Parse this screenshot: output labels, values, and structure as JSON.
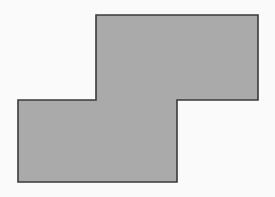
{
  "figure": {
    "name": "step-polygon-figure",
    "canvas": {
      "width": 275,
      "height": 197,
      "background_color": "#fafafa"
    },
    "shape": {
      "name": "z-step-hexagon",
      "type": "polygon",
      "vertex_count": 8,
      "fill_color": "#aaaaaa",
      "stroke_color": "#3a3a3a",
      "stroke_width": 1.6,
      "points": "96,15 258,15 258,100 177,100 177,182 18,182 18,100 96,100",
      "vertices": [
        {
          "label": "top-left",
          "x": 96,
          "y": 15
        },
        {
          "label": "top-right",
          "x": 258,
          "y": 15
        },
        {
          "label": "right-step-outer",
          "x": 258,
          "y": 100
        },
        {
          "label": "right-step-inner",
          "x": 177,
          "y": 100
        },
        {
          "label": "bottom-right",
          "x": 177,
          "y": 182
        },
        {
          "label": "bottom-left",
          "x": 18,
          "y": 182
        },
        {
          "label": "left-step-outer",
          "x": 18,
          "y": 100
        },
        {
          "label": "left-step-inner",
          "x": 96,
          "y": 100
        }
      ],
      "edges": [
        {
          "name": "top-edge",
          "from": "top-left",
          "to": "top-right",
          "orientation": "horizontal"
        },
        {
          "name": "upper-right-edge",
          "from": "top-right",
          "to": "right-step-outer",
          "orientation": "vertical"
        },
        {
          "name": "right-notch-edge",
          "from": "right-step-outer",
          "to": "right-step-inner",
          "orientation": "horizontal"
        },
        {
          "name": "lower-right-edge",
          "from": "right-step-inner",
          "to": "bottom-right",
          "orientation": "vertical"
        },
        {
          "name": "bottom-edge",
          "from": "bottom-right",
          "to": "bottom-left",
          "orientation": "horizontal"
        },
        {
          "name": "lower-left-edge",
          "from": "bottom-left",
          "to": "left-step-outer",
          "orientation": "vertical"
        },
        {
          "name": "left-notch-edge",
          "from": "left-step-outer",
          "to": "left-step-inner",
          "orientation": "horizontal"
        },
        {
          "name": "upper-left-edge",
          "from": "left-step-inner",
          "to": "top-left",
          "orientation": "vertical"
        }
      ]
    }
  }
}
